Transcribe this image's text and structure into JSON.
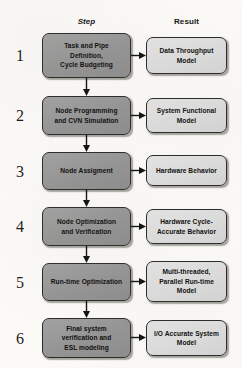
{
  "diagram": {
    "title_row": {
      "step_header": "Step",
      "result_header": "Result"
    },
    "rows": [
      {
        "number": "1",
        "step": [
          "Task and Pipe",
          "Definition,",
          "Cycle Budgeting"
        ],
        "result": [
          "Data Throughput",
          "Model"
        ]
      },
      {
        "number": "2",
        "step": [
          "Node Programming",
          "and CVN Simulation"
        ],
        "result": [
          "System Functional",
          "Model"
        ]
      },
      {
        "number": "3",
        "step": [
          "Node Assigment"
        ],
        "result": [
          "Hardware Behavior"
        ]
      },
      {
        "number": "4",
        "step": [
          "Node Optimization",
          "and Verification"
        ],
        "result": [
          "Hardware Cycle-",
          "Accurate Behavior"
        ]
      },
      {
        "number": "5",
        "step": [
          "Run-time Optimization"
        ],
        "result": [
          "Multi-threaded,",
          "Parallel Run-time",
          "Model"
        ]
      },
      {
        "number": "6",
        "step": [
          "Final system",
          "verification  and",
          "ESL  modeling"
        ],
        "result": [
          "I/O Accurate System",
          "Model"
        ]
      }
    ],
    "colors": {
      "background": "#fbfaf7",
      "step_box_fill": "#9a9a9a",
      "result_box_fill": "#dedede",
      "box_border": "#2a2a2a",
      "arrow": "#111111",
      "text": "#0e0e0e"
    }
  }
}
